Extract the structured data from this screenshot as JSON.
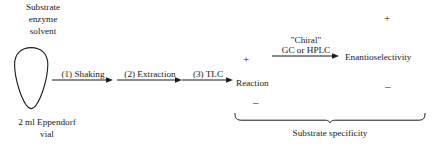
{
  "figure": {
    "background_color": "#ffffff",
    "ink_color": "#1a1a1a",
    "reagents": {
      "line1": "Substrate",
      "line2": "enzyme",
      "line3": "solvent"
    },
    "vial": {
      "caption_line1": "2 ml Eppendorf",
      "caption_line2": "vial"
    },
    "steps": [
      {
        "label": "(1) Shaking"
      },
      {
        "label": "(2) Extraction"
      },
      {
        "label": "(3) TLC"
      }
    ],
    "analysis_arrow": {
      "label_line1": "\"Chiral\"",
      "label_line2": "GC or HPLC"
    },
    "outcomes": [
      {
        "name": "Reaction",
        "plus": "+",
        "minus": "–"
      },
      {
        "name": "Enantioselectivity",
        "plus": "+",
        "minus": "–"
      }
    ],
    "brace_label": "Substrate specificity"
  }
}
